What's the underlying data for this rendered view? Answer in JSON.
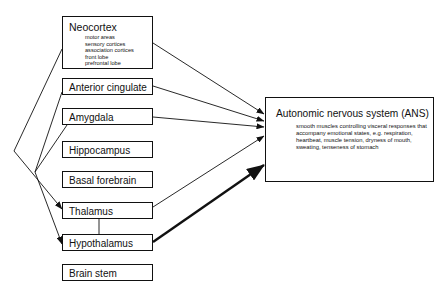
{
  "left_boxes": {
    "neocortex": {
      "label": "Neocortex",
      "items": [
        "motor areas",
        "sensory cortices",
        "association cortices",
        "front lobe",
        "prefrontal lobe"
      ]
    },
    "anterior_cingulate": {
      "label": "Anterior cingulate"
    },
    "amygdala": {
      "label": "Amygdala"
    },
    "hippocampus": {
      "label": "Hippocampus"
    },
    "basal_forebrain": {
      "label": "Basal forebrain"
    },
    "thalamus": {
      "label": "Thalamus"
    },
    "hypothalamus": {
      "label": "Hypothalamus"
    },
    "brain_stem": {
      "label": "Brain stem"
    }
  },
  "ans_box": {
    "title": "Autonomic nervous system (ANS)",
    "body": "smooth muscles controlling visceral responses that accompany emotional states, e.g. respiration, heartbeat, muscle tension, dryness of mouth, sweating, tenseness of stomach"
  },
  "colors": {
    "line": "#111111",
    "background": "#ffffff"
  }
}
